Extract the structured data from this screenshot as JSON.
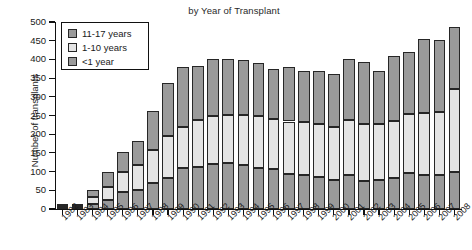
{
  "title": {
    "line1": "",
    "line2": "by Year of Transplant"
  },
  "axes": {
    "ylabel": "Number of transplants",
    "xlabel": ""
  },
  "legend": {
    "position": "top-left",
    "items": [
      {
        "label": "11-17 years",
        "color": "#9a9a9a",
        "key": "y11_17"
      },
      {
        "label": "1-10 years",
        "color": "#e4e4e4",
        "key": "y1_10"
      },
      {
        "label": "<1 year",
        "color": "#9a9a9a",
        "key": "under1"
      }
    ]
  },
  "chart_data": {
    "type": "bar",
    "subtype": "stacked",
    "title": "by Year of Transplant",
    "xlabel": "",
    "ylabel": "Number of transplants",
    "ylim": [
      0,
      500
    ],
    "ytick_step": 50,
    "yticks": [
      0,
      50,
      100,
      150,
      200,
      250,
      300,
      350,
      400,
      450,
      500
    ],
    "grid": false,
    "legend_position": "top-left",
    "categories": [
      "1982",
      "1983",
      "1984",
      "1985",
      "1986",
      "1987",
      "1988",
      "1989",
      "1990",
      "1991",
      "1992",
      "1993",
      "1994",
      "1995",
      "1996",
      "1997",
      "1998",
      "1999",
      "2000",
      "2001",
      "2002",
      "2003",
      "2004",
      "2005",
      "2006",
      "2007",
      "2008"
    ],
    "series": [
      {
        "name": "<1 year",
        "color": "#9a9a9a",
        "values": [
          4,
          5,
          13,
          24,
          46,
          52,
          70,
          83,
          110,
          112,
          120,
          122,
          118,
          110,
          108,
          94,
          92,
          86,
          78,
          92,
          76,
          78,
          84,
          96,
          92,
          90,
          98
        ]
      },
      {
        "name": "1-10 years",
        "color": "#e4e4e4",
        "values": [
          3,
          4,
          20,
          36,
          54,
          66,
          88,
          112,
          108,
          126,
          128,
          130,
          134,
          138,
          132,
          140,
          140,
          142,
          140,
          146,
          150,
          150,
          152,
          158,
          166,
          170,
          222
        ]
      },
      {
        "name": "11-17 years",
        "color": "#9a9a9a",
        "values": [
          2,
          4,
          17,
          40,
          52,
          64,
          104,
          143,
          162,
          144,
          152,
          148,
          146,
          142,
          134,
          146,
          138,
          142,
          142,
          162,
          166,
          142,
          174,
          166,
          196,
          192,
          166
        ]
      }
    ],
    "totals": [
      9,
      13,
      50,
      100,
      152,
      182,
      262,
      338,
      380,
      382,
      400,
      400,
      398,
      390,
      374,
      380,
      370,
      370,
      360,
      400,
      392,
      370,
      410,
      420,
      454,
      452,
      486
    ]
  }
}
